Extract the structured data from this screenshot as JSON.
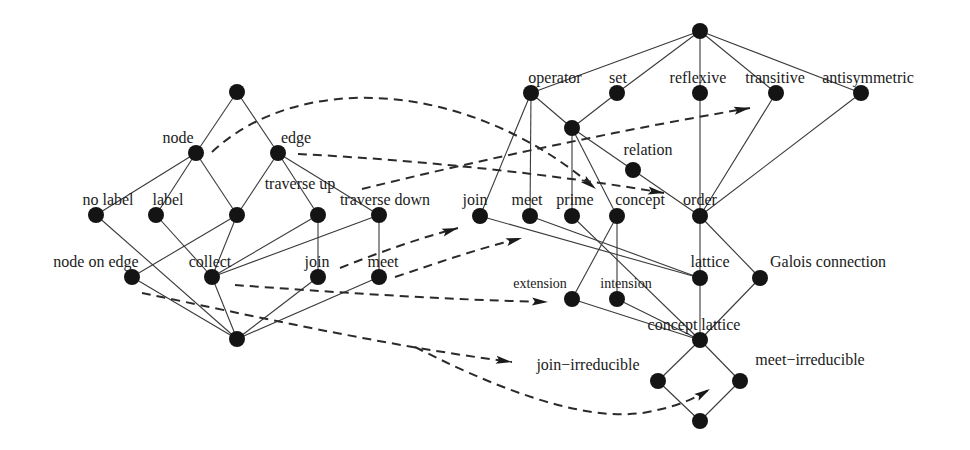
{
  "diagram": {
    "type": "concept-lattice-mapping",
    "colors": {
      "background": "#ffffff",
      "node": "#141414",
      "edge": "#3a3a3a",
      "dashed": "#2a2a2a",
      "text": "#1a1a1a"
    },
    "left_lattice": {
      "nodes": [
        {
          "id": "L_top",
          "x": 237,
          "y": 92,
          "label": ""
        },
        {
          "id": "L_node",
          "x": 196,
          "y": 153,
          "label": "node",
          "lx": 178,
          "ly": 143,
          "anchor": "middle"
        },
        {
          "id": "L_edge",
          "x": 278,
          "y": 153,
          "label": "edge",
          "lx": 296,
          "ly": 143,
          "anchor": "middle"
        },
        {
          "id": "L_nolabel",
          "x": 96,
          "y": 215,
          "label": "no label",
          "lx": 108,
          "ly": 205,
          "anchor": "middle"
        },
        {
          "id": "L_label",
          "x": 156,
          "y": 215,
          "label": "label",
          "lx": 168,
          "ly": 205,
          "anchor": "middle"
        },
        {
          "id": "L_mid",
          "x": 237,
          "y": 215,
          "label": ""
        },
        {
          "id": "L_travup",
          "x": 318,
          "y": 215,
          "label": "traverse up",
          "lx": 300,
          "ly": 189,
          "anchor": "middle"
        },
        {
          "id": "L_travdown",
          "x": 379,
          "y": 215,
          "label": "traverse down",
          "lx": 385,
          "ly": 205,
          "anchor": "middle"
        },
        {
          "id": "L_nodeonedge",
          "x": 132,
          "y": 277,
          "label": "node on edge",
          "lx": 96,
          "ly": 267,
          "anchor": "middle"
        },
        {
          "id": "L_collect",
          "x": 212,
          "y": 277,
          "label": "collect",
          "lx": 210,
          "ly": 267,
          "anchor": "middle"
        },
        {
          "id": "L_join",
          "x": 318,
          "y": 277,
          "label": "join",
          "lx": 317,
          "ly": 267,
          "anchor": "middle"
        },
        {
          "id": "L_meet",
          "x": 379,
          "y": 277,
          "label": "meet",
          "lx": 383,
          "ly": 267,
          "anchor": "middle"
        },
        {
          "id": "L_bottom",
          "x": 237,
          "y": 339,
          "label": ""
        }
      ],
      "edges": [
        [
          "L_top",
          "L_node"
        ],
        [
          "L_top",
          "L_edge"
        ],
        [
          "L_node",
          "L_nolabel"
        ],
        [
          "L_node",
          "L_label"
        ],
        [
          "L_node",
          "L_mid"
        ],
        [
          "L_edge",
          "L_mid"
        ],
        [
          "L_edge",
          "L_travup"
        ],
        [
          "L_edge",
          "L_travdown"
        ],
        [
          "L_mid",
          "L_nodeonedge"
        ],
        [
          "L_mid",
          "L_collect"
        ],
        [
          "L_travup",
          "L_collect"
        ],
        [
          "L_travup",
          "L_join"
        ],
        [
          "L_travdown",
          "L_collect"
        ],
        [
          "L_travdown",
          "L_meet"
        ],
        [
          "L_nolabel",
          "L_bottom"
        ],
        [
          "L_label",
          "L_collect"
        ],
        [
          "L_nodeonedge",
          "L_bottom"
        ],
        [
          "L_collect",
          "L_bottom"
        ],
        [
          "L_join",
          "L_bottom"
        ],
        [
          "L_meet",
          "L_bottom"
        ]
      ]
    },
    "right_lattice": {
      "nodes": [
        {
          "id": "R_top",
          "x": 700,
          "y": 31,
          "label": ""
        },
        {
          "id": "R_operator",
          "x": 531,
          "y": 93,
          "label": "operator",
          "lx": 555,
          "ly": 83,
          "anchor": "middle"
        },
        {
          "id": "R_set",
          "x": 617,
          "y": 93,
          "label": "set",
          "lx": 618,
          "ly": 83,
          "anchor": "middle"
        },
        {
          "id": "R_reflexive",
          "x": 700,
          "y": 93,
          "label": "reflexive",
          "lx": 698,
          "ly": 83,
          "anchor": "middle"
        },
        {
          "id": "R_transitive",
          "x": 776,
          "y": 93,
          "label": "transitive",
          "lx": 775,
          "ly": 83,
          "anchor": "middle"
        },
        {
          "id": "R_antisymmetric",
          "x": 861,
          "y": 93,
          "label": "antisymmetric",
          "lx": 868,
          "ly": 83,
          "anchor": "middle"
        },
        {
          "id": "R_opset",
          "x": 572,
          "y": 128,
          "label": ""
        },
        {
          "id": "R_relation",
          "x": 633,
          "y": 170,
          "label": "relation",
          "lx": 648,
          "ly": 155,
          "anchor": "middle"
        },
        {
          "id": "R_join",
          "x": 480,
          "y": 216,
          "label": "join",
          "lx": 475,
          "ly": 205,
          "anchor": "middle"
        },
        {
          "id": "R_meet",
          "x": 530,
          "y": 216,
          "label": "meet",
          "lx": 527,
          "ly": 205,
          "anchor": "middle"
        },
        {
          "id": "R_prime",
          "x": 572,
          "y": 216,
          "label": "prime",
          "lx": 575,
          "ly": 205,
          "anchor": "middle"
        },
        {
          "id": "R_concept",
          "x": 617,
          "y": 216,
          "label": "concept",
          "lx": 640,
          "ly": 205,
          "anchor": "middle"
        },
        {
          "id": "R_order",
          "x": 700,
          "y": 216,
          "label": "order",
          "lx": 700,
          "ly": 205,
          "anchor": "middle"
        },
        {
          "id": "R_lattice",
          "x": 700,
          "y": 278,
          "label": "lattice",
          "lx": 710,
          "ly": 267,
          "anchor": "middle"
        },
        {
          "id": "R_galois",
          "x": 760,
          "y": 278,
          "label": "Galois connection",
          "lx": 828,
          "ly": 267,
          "anchor": "middle"
        },
        {
          "id": "R_extension",
          "x": 572,
          "y": 299,
          "label": "extension",
          "lx": 540,
          "ly": 288,
          "anchor": "middle",
          "small": true
        },
        {
          "id": "R_intension",
          "x": 617,
          "y": 299,
          "label": "intension",
          "lx": 626,
          "ly": 288,
          "anchor": "middle",
          "small": true
        },
        {
          "id": "R_conceptlattice",
          "x": 700,
          "y": 340,
          "label": "concept lattice",
          "lx": 694,
          "ly": 330,
          "anchor": "middle"
        },
        {
          "id": "R_joinirr",
          "x": 658,
          "y": 381,
          "label": "join−irreducible",
          "lx": 588,
          "ly": 370,
          "anchor": "middle"
        },
        {
          "id": "R_meetirr",
          "x": 740,
          "y": 381,
          "label": "meet−irreducible",
          "lx": 810,
          "ly": 365,
          "anchor": "middle"
        },
        {
          "id": "R_bottom",
          "x": 700,
          "y": 421,
          "label": ""
        }
      ],
      "edges": [
        [
          "R_top",
          "R_operator"
        ],
        [
          "R_top",
          "R_set"
        ],
        [
          "R_top",
          "R_reflexive"
        ],
        [
          "R_top",
          "R_transitive"
        ],
        [
          "R_top",
          "R_antisymmetric"
        ],
        [
          "R_operator",
          "R_join"
        ],
        [
          "R_operator",
          "R_meet"
        ],
        [
          "R_operator",
          "R_opset"
        ],
        [
          "R_set",
          "R_opset"
        ],
        [
          "R_opset",
          "R_prime"
        ],
        [
          "R_opset",
          "R_concept"
        ],
        [
          "R_opset",
          "R_relation"
        ],
        [
          "R_relation",
          "R_order"
        ],
        [
          "R_reflexive",
          "R_order"
        ],
        [
          "R_transitive",
          "R_order"
        ],
        [
          "R_antisymmetric",
          "R_order"
        ],
        [
          "R_join",
          "R_lattice"
        ],
        [
          "R_meet",
          "R_lattice"
        ],
        [
          "R_prime",
          "R_conceptlattice"
        ],
        [
          "R_concept",
          "R_extension"
        ],
        [
          "R_concept",
          "R_intension"
        ],
        [
          "R_order",
          "R_lattice"
        ],
        [
          "R_order",
          "R_galois"
        ],
        [
          "R_lattice",
          "R_conceptlattice"
        ],
        [
          "R_extension",
          "R_conceptlattice"
        ],
        [
          "R_intension",
          "R_conceptlattice"
        ],
        [
          "R_galois",
          "R_conceptlattice"
        ],
        [
          "R_conceptlattice",
          "R_joinirr"
        ],
        [
          "R_conceptlattice",
          "R_meetirr"
        ],
        [
          "R_joinirr",
          "R_bottom"
        ],
        [
          "R_meetirr",
          "R_bottom"
        ]
      ]
    },
    "mappings": [
      {
        "from": "node",
        "to": "concept",
        "path": "M 212 152 C 300 70, 470 80, 596 189",
        "tip": [
          596,
          189
        ],
        "angle": 38
      },
      {
        "from": "edge",
        "to": "order",
        "path": "M 298 154 C 420 160, 560 175, 664 193",
        "tip": [
          664,
          193
        ],
        "angle": 9
      },
      {
        "from": "traverse up",
        "to": "transitive",
        "path": "M 362 189 C 480 160, 620 130, 750 108",
        "tip": [
          750,
          108
        ],
        "angle": -10
      },
      {
        "from": "join",
        "to": "join",
        "path": "M 340 268 C 380 252, 420 238, 458 228",
        "tip": [
          458,
          228
        ],
        "angle": -17
      },
      {
        "from": "meet",
        "to": "meet",
        "path": "M 395 277 C 440 262, 480 248, 522 238",
        "tip": [
          522,
          238
        ],
        "angle": -15
      },
      {
        "from": "collect",
        "to": "extension",
        "path": "M 235 285 C 330 292, 450 300, 548 302",
        "tip": [
          548,
          302
        ],
        "angle": 2
      },
      {
        "from": "node on edge",
        "to": "join-irreducible",
        "path": "M 142 293 C 250 315, 380 345, 512 362",
        "tip": [
          512,
          362
        ],
        "angle": 8
      },
      {
        "from": "node on edge",
        "to": "meet-irreducible",
        "path": "M 415 347 C 480 380, 580 425, 648 412 C 680 406, 695 398, 710 389",
        "tip": [
          710,
          389
        ],
        "angle": -32
      }
    ]
  }
}
